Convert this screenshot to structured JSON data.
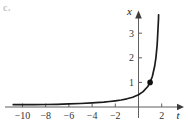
{
  "figure_label": "c.",
  "chart_data": {
    "type": "line",
    "title": "",
    "xlabel": "t",
    "ylabel": "x",
    "x_ticks": [
      -10,
      -8,
      -6,
      -4,
      -2,
      2
    ],
    "y_ticks": [
      1,
      2,
      3
    ],
    "xlim": [
      -11.5,
      3.9
    ],
    "ylim": [
      0,
      3.95
    ],
    "grid": false,
    "legend": false,
    "series": [
      {
        "name": "solution-curve",
        "points": [
          [
            -10.8,
            0.0781
          ],
          [
            -10,
            0.0833
          ],
          [
            -9,
            0.0909
          ],
          [
            -8,
            0.1
          ],
          [
            -7,
            0.1111
          ],
          [
            -6,
            0.125
          ],
          [
            -5,
            0.1429
          ],
          [
            -4,
            0.1667
          ],
          [
            -3,
            0.2
          ],
          [
            -2.5,
            0.2222
          ],
          [
            -2,
            0.25
          ],
          [
            -1.5,
            0.2857
          ],
          [
            -1,
            0.3333
          ],
          [
            -0.5,
            0.4
          ],
          [
            0,
            0.5
          ],
          [
            0.4,
            0.625
          ],
          [
            0.8,
            0.8333
          ],
          [
            1,
            1.0
          ],
          [
            1.2,
            1.25
          ],
          [
            1.4,
            1.6667
          ],
          [
            1.5,
            2.0
          ],
          [
            1.6,
            2.5
          ],
          [
            1.65,
            2.857
          ],
          [
            1.7,
            3.333
          ],
          [
            1.72,
            3.571
          ],
          [
            1.733,
            3.75
          ]
        ]
      }
    ],
    "marked_point": {
      "t": 1,
      "x": 1
    },
    "colors": {
      "curve": "#1b1b1b",
      "axis": "#5f5f5f",
      "tick_label": "#333333",
      "point": "#111111",
      "corner_label": "#c5c5c5",
      "background": "#ffffff"
    }
  }
}
